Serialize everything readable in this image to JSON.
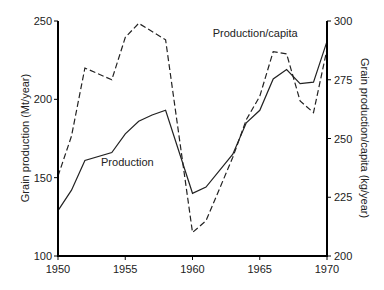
{
  "chart_data": {
    "type": "line",
    "title": "",
    "xlabel": "",
    "ylabel": "Grain production (Mt/year)",
    "ylabel_right": "Grain production/capita (kg/year)",
    "xlim": [
      1950,
      1970
    ],
    "ylim": [
      100,
      250
    ],
    "ylim_right": [
      200,
      300
    ],
    "x_ticks": [
      "1950",
      "1955",
      "1960",
      "1965",
      "1970"
    ],
    "y_ticks": [
      "100",
      "150",
      "200",
      "250"
    ],
    "y_ticks_right": [
      "200",
      "225",
      "250",
      "275",
      "300"
    ],
    "grid": false,
    "legend": "inline labels",
    "series": [
      {
        "name": "Production",
        "axis": "left",
        "style": "solid",
        "x": [
          1950,
          1951,
          1952,
          1954,
          1955,
          1956,
          1957,
          1958,
          1960,
          1961,
          1963,
          1964,
          1965,
          1966,
          1967,
          1968,
          1969,
          1970
        ],
        "values": [
          129,
          142,
          161,
          166,
          178,
          186,
          190,
          193,
          140,
          144,
          165,
          185,
          193,
          213,
          219,
          210,
          211,
          237
        ]
      },
      {
        "name": "Production/capita",
        "axis": "right",
        "style": "dashed",
        "x": [
          1950,
          1951,
          1952,
          1954,
          1955,
          1956,
          1958,
          1960,
          1961,
          1963,
          1964,
          1965,
          1966,
          1967,
          1968,
          1969,
          1970
        ],
        "values": [
          234,
          251,
          280,
          275,
          293,
          299,
          292,
          210,
          215,
          242,
          258,
          268,
          287,
          286,
          266,
          261,
          288
        ]
      }
    ],
    "annotations": [
      {
        "text": "Production/capita",
        "x": 1961.5,
        "y_right": 295
      },
      {
        "text": "Production",
        "x": 1953.2,
        "y": 160
      }
    ]
  }
}
